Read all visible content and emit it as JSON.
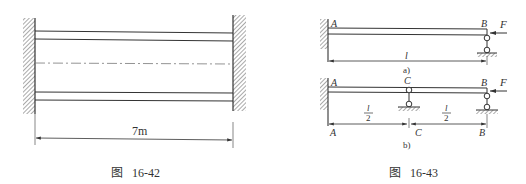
{
  "figure_left": {
    "caption": "图   16-42",
    "dimension_label": "7m",
    "description": "Fixed-fixed beam between two walls with centerline"
  },
  "figure_right": {
    "caption": "图   16-43",
    "sub_a": {
      "label": "a)",
      "point_a": "A",
      "point_b": "B",
      "force": "F",
      "length": "l"
    },
    "sub_b": {
      "label": "b)",
      "point_a": "A",
      "point_c": "C",
      "point_b": "B",
      "force": "F",
      "half_num": "l",
      "half_den": "2",
      "dim_a": "A",
      "dim_c": "C",
      "dim_b": "B"
    }
  }
}
